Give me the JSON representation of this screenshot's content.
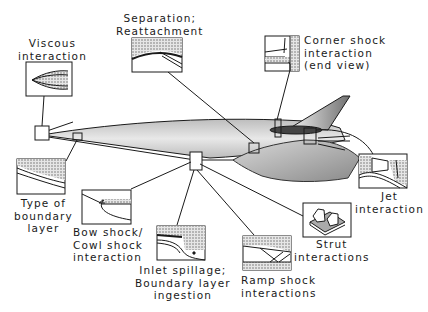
{
  "diagram": {
    "callouts": [
      {
        "id": "viscous",
        "lines": [
          "Viscous",
          "interaction"
        ]
      },
      {
        "id": "separation",
        "lines": [
          "Separation;",
          "Reattachment"
        ]
      },
      {
        "id": "corner",
        "lines": [
          "Corner shock",
          "interaction",
          "(end view)"
        ]
      },
      {
        "id": "boundary",
        "lines": [
          "Type of",
          "boundary",
          "layer"
        ]
      },
      {
        "id": "bowshock",
        "lines": [
          "Bow shock/",
          "Cowl shock",
          "interaction"
        ]
      },
      {
        "id": "inlet",
        "lines": [
          "Inlet spillage;",
          "Boundary layer",
          "ingestion"
        ]
      },
      {
        "id": "ramp",
        "lines": [
          "Ramp shock",
          "interactions"
        ]
      },
      {
        "id": "strut",
        "lines": [
          "Strut",
          "interactions"
        ]
      },
      {
        "id": "jet",
        "lines": [
          "Jet",
          "interaction"
        ]
      }
    ],
    "colors": {
      "line": "#1a1a1a",
      "shade": "#9a9a9a",
      "background": "#ffffff"
    }
  }
}
